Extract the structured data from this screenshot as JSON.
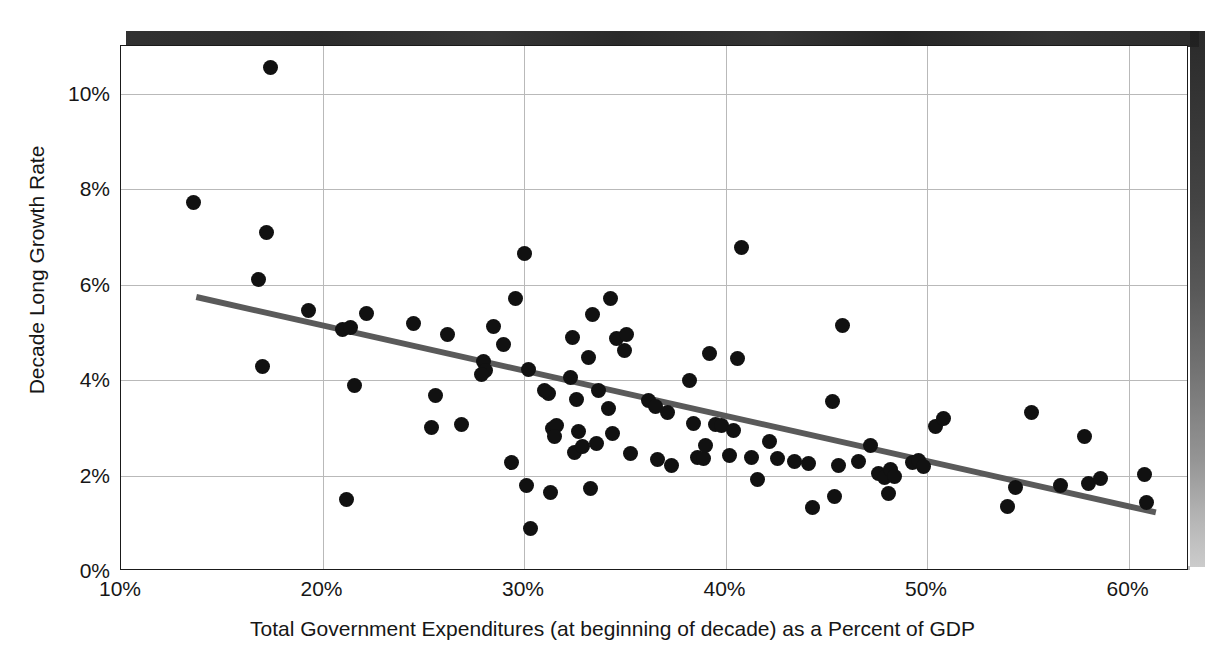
{
  "chart_data": {
    "type": "scatter",
    "title": "",
    "xlabel": "Total Government Expenditures (at beginning of decade) as a Percent of GDP",
    "ylabel": "Decade Long Growth Rate",
    "xlim": [
      10,
      63
    ],
    "ylim": [
      0,
      11
    ],
    "xticks": [
      "10%",
      "20%",
      "30%",
      "40%",
      "50%",
      "60%"
    ],
    "xtick_values": [
      10,
      20,
      30,
      40,
      50,
      60
    ],
    "yticks": [
      "0%",
      "2%",
      "4%",
      "6%",
      "8%",
      "10%"
    ],
    "ytick_values": [
      0,
      2,
      4,
      6,
      8,
      10
    ],
    "grid": true,
    "legend": "none",
    "marker_color": "#111111",
    "trendline_color": "#5a5a5a",
    "trendline": {
      "x": [
        13.7,
        61.5
      ],
      "y": [
        5.72,
        1.19
      ]
    },
    "points": [
      [
        13.6,
        7.72
      ],
      [
        17.4,
        10.55
      ],
      [
        17.2,
        7.1
      ],
      [
        16.8,
        6.11
      ],
      [
        17.0,
        4.28
      ],
      [
        19.3,
        5.45
      ],
      [
        21.0,
        5.06
      ],
      [
        21.4,
        5.1
      ],
      [
        22.2,
        5.39
      ],
      [
        21.6,
        3.88
      ],
      [
        21.2,
        1.49
      ],
      [
        24.5,
        5.18
      ],
      [
        25.6,
        3.67
      ],
      [
        25.4,
        3.01
      ],
      [
        26.2,
        4.95
      ],
      [
        26.9,
        3.08
      ],
      [
        28.0,
        4.4
      ],
      [
        28.1,
        4.2
      ],
      [
        27.9,
        4.12
      ],
      [
        28.5,
        5.12
      ],
      [
        29.0,
        4.75
      ],
      [
        29.4,
        2.28
      ],
      [
        29.6,
        5.7
      ],
      [
        30.0,
        6.66
      ],
      [
        30.2,
        4.22
      ],
      [
        30.1,
        1.79
      ],
      [
        30.3,
        0.89
      ],
      [
        31.2,
        3.71
      ],
      [
        31.0,
        3.78
      ],
      [
        31.4,
        2.98
      ],
      [
        31.6,
        3.05
      ],
      [
        31.5,
        2.81
      ],
      [
        31.3,
        1.64
      ],
      [
        32.4,
        4.9
      ],
      [
        32.3,
        4.05
      ],
      [
        32.6,
        3.6
      ],
      [
        32.7,
        2.92
      ],
      [
        32.5,
        2.48
      ],
      [
        32.9,
        2.6
      ],
      [
        33.4,
        5.37
      ],
      [
        33.2,
        4.48
      ],
      [
        33.7,
        3.79
      ],
      [
        33.6,
        2.67
      ],
      [
        33.3,
        1.72
      ],
      [
        34.3,
        5.7
      ],
      [
        34.6,
        4.88
      ],
      [
        34.2,
        3.41
      ],
      [
        34.4,
        2.89
      ],
      [
        35.1,
        4.95
      ],
      [
        35.0,
        4.63
      ],
      [
        35.3,
        2.46
      ],
      [
        36.2,
        3.58
      ],
      [
        36.5,
        3.44
      ],
      [
        36.6,
        2.33
      ],
      [
        37.1,
        3.32
      ],
      [
        37.3,
        2.21
      ],
      [
        38.2,
        4.0
      ],
      [
        38.4,
        3.1
      ],
      [
        38.6,
        2.38
      ],
      [
        38.9,
        2.35
      ],
      [
        39.2,
        4.56
      ],
      [
        39.0,
        2.62
      ],
      [
        39.5,
        3.08
      ],
      [
        39.8,
        3.05
      ],
      [
        40.8,
        6.78
      ],
      [
        40.6,
        4.45
      ],
      [
        40.4,
        2.94
      ],
      [
        40.2,
        2.42
      ],
      [
        41.3,
        2.38
      ],
      [
        41.6,
        1.92
      ],
      [
        42.2,
        2.72
      ],
      [
        42.6,
        2.36
      ],
      [
        43.4,
        2.3
      ],
      [
        44.1,
        2.26
      ],
      [
        44.3,
        1.33
      ],
      [
        45.3,
        3.56
      ],
      [
        45.8,
        5.14
      ],
      [
        45.6,
        2.22
      ],
      [
        45.4,
        1.57
      ],
      [
        46.6,
        2.29
      ],
      [
        47.2,
        2.62
      ],
      [
        47.6,
        2.05
      ],
      [
        47.9,
        1.96
      ],
      [
        48.2,
        2.12
      ],
      [
        48.4,
        1.99
      ],
      [
        48.1,
        1.63
      ],
      [
        49.3,
        2.28
      ],
      [
        49.6,
        2.32
      ],
      [
        49.8,
        2.2
      ],
      [
        50.4,
        3.02
      ],
      [
        50.8,
        3.19
      ],
      [
        54.0,
        1.36
      ],
      [
        54.4,
        1.76
      ],
      [
        55.2,
        3.33
      ],
      [
        56.6,
        1.79
      ],
      [
        57.8,
        2.82
      ],
      [
        58.0,
        1.84
      ],
      [
        58.6,
        1.93
      ],
      [
        60.8,
        2.02
      ],
      [
        60.9,
        1.44
      ]
    ]
  }
}
